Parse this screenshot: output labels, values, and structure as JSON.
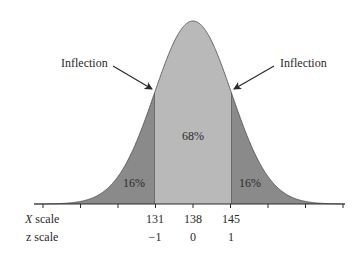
{
  "chart_data": {
    "type": "area",
    "title": "",
    "mean": 138,
    "sd": 7,
    "regions": [
      {
        "name": "left-tail",
        "from": null,
        "to": 131,
        "label": "16%",
        "color": "#8a8a8a"
      },
      {
        "name": "center",
        "from": 131,
        "to": 145,
        "label": "68%",
        "color": "#b9b9b9"
      },
      {
        "name": "right-tail",
        "from": 145,
        "to": null,
        "label": "16%",
        "color": "#8a8a8a"
      }
    ],
    "annotations": [
      {
        "text": "Inflection",
        "points_to_x": 131
      },
      {
        "text": "Inflection",
        "points_to_x": 145
      }
    ],
    "x_scale": {
      "label": "X scale",
      "ticks": [
        "131",
        "138",
        "145"
      ]
    },
    "z_scale": {
      "label": "z scale",
      "ticks": [
        "−1",
        "0",
        "1"
      ]
    },
    "unlabeled_ticks": 6,
    "grid": false,
    "legend": null
  },
  "labels": {
    "inflection_left": "Inflection",
    "inflection_right": "Inflection",
    "pct_center": "68%",
    "pct_left": "16%",
    "pct_right": "16%",
    "x_scale_label": "X scale",
    "z_scale_label": "z scale",
    "x_tick_131": "131",
    "x_tick_138": "138",
    "x_tick_145": "145",
    "z_tick_m1": "−1",
    "z_tick_0": "0",
    "z_tick_1": "1"
  }
}
